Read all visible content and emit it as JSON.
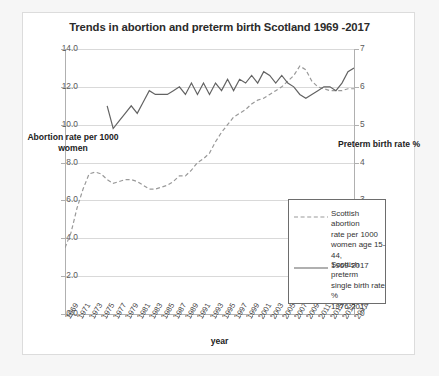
{
  "chart_data": {
    "type": "line",
    "title": "Trends in abortion and preterm birth Scotland 1969 -2017",
    "xlabel": "year",
    "ylabel_left": "Abortion rate per 1000 women",
    "ylabel_right": "Preterm birth rate %",
    "grid": true,
    "legend_position": "inside-right",
    "ylim_left": [
      0.0,
      14.0
    ],
    "ylim_right": [
      0,
      7
    ],
    "yticks_left": [
      "0.0",
      "2.0",
      "4.0",
      "6.0",
      "8.0",
      "10.0",
      "12.0",
      "14.0"
    ],
    "yticks_right": [
      "0",
      "1",
      "2",
      "3",
      "4",
      "5",
      "6",
      "7"
    ],
    "xlim": [
      1969,
      2017
    ],
    "xticks": [
      "1969",
      "1971",
      "1973",
      "1975",
      "1977",
      "1979",
      "1981",
      "1983",
      "1985",
      "1987",
      "1989",
      "1991",
      "1993",
      "1995",
      "1997",
      "1999",
      "2001",
      "2003",
      "2005",
      "2007",
      "2009",
      "2011",
      "2013",
      "2015",
      "2017"
    ],
    "x_all_years": [
      1969,
      1970,
      1971,
      1972,
      1973,
      1974,
      1975,
      1976,
      1977,
      1978,
      1979,
      1980,
      1981,
      1982,
      1983,
      1984,
      1985,
      1986,
      1987,
      1988,
      1989,
      1990,
      1991,
      1992,
      1993,
      1994,
      1995,
      1996,
      1997,
      1998,
      1999,
      2000,
      2001,
      2002,
      2003,
      2004,
      2005,
      2006,
      2007,
      2008,
      2009,
      2010,
      2011,
      2012,
      2013,
      2014,
      2015,
      2016,
      2017
    ],
    "series": [
      {
        "name": "Scottish abortion rate per 1000 women age 15-44, 1969-2017",
        "axis": "left",
        "style": "dashed",
        "color": "#999999",
        "legend_label_lines": "Scottish abortion\nrate per 1000\nwomen age 15-44,\n1969-2017",
        "x": [
          1969,
          1970,
          1971,
          1972,
          1973,
          1974,
          1975,
          1976,
          1977,
          1978,
          1979,
          1980,
          1981,
          1982,
          1983,
          1984,
          1985,
          1986,
          1987,
          1988,
          1989,
          1990,
          1991,
          1992,
          1993,
          1994,
          1995,
          1996,
          1997,
          1998,
          1999,
          2000,
          2001,
          2002,
          2003,
          2004,
          2005,
          2006,
          2007,
          2008,
          2009,
          2010,
          2011,
          2012,
          2013,
          2014,
          2015,
          2016,
          2017
        ],
        "values": [
          3.5,
          4.3,
          5.6,
          6.6,
          7.4,
          7.5,
          7.4,
          7.1,
          6.9,
          7.0,
          7.1,
          7.1,
          7.0,
          6.8,
          6.6,
          6.6,
          6.7,
          6.8,
          7.0,
          7.3,
          7.3,
          7.6,
          8.0,
          8.2,
          8.5,
          9.1,
          9.6,
          10.0,
          10.4,
          10.6,
          10.8,
          11.1,
          11.3,
          11.4,
          11.6,
          11.8,
          12.0,
          12.3,
          12.6,
          13.1,
          12.9,
          12.3,
          12.0,
          11.9,
          11.8,
          11.8,
          11.8,
          11.9,
          11.9
        ]
      },
      {
        "name": "Scottish preterm single birth rate % 1976-2017",
        "axis": "right",
        "style": "solid",
        "color": "#636363",
        "legend_label_lines": "Scottish preterm\nsingle birth rate %\n1976-2017",
        "x": [
          1976,
          1977,
          1978,
          1979,
          1980,
          1981,
          1982,
          1983,
          1984,
          1985,
          1986,
          1987,
          1988,
          1989,
          1990,
          1991,
          1992,
          1993,
          1994,
          1995,
          1996,
          1997,
          1998,
          1999,
          2000,
          2001,
          2002,
          2003,
          2004,
          2005,
          2006,
          2007,
          2008,
          2009,
          2010,
          2011,
          2012,
          2013,
          2014,
          2015,
          2016,
          2017
        ],
        "values": [
          5.5,
          4.9,
          5.1,
          5.3,
          5.5,
          5.3,
          5.6,
          5.9,
          5.8,
          5.8,
          5.8,
          5.9,
          6.0,
          5.8,
          6.1,
          5.8,
          6.1,
          5.8,
          6.1,
          5.9,
          6.2,
          5.9,
          6.2,
          6.1,
          6.3,
          6.1,
          6.4,
          6.3,
          6.1,
          6.3,
          6.1,
          6.0,
          5.8,
          5.7,
          5.8,
          5.9,
          6.0,
          6.0,
          5.9,
          6.1,
          6.4,
          6.5
        ]
      }
    ]
  }
}
